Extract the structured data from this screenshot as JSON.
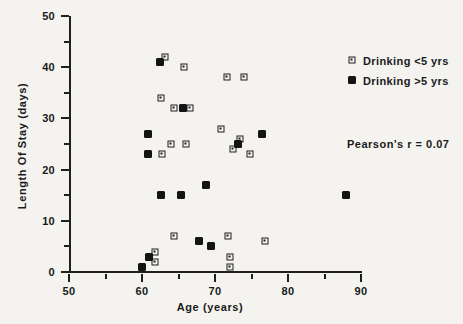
{
  "chart_data": {
    "type": "scatter",
    "title": "",
    "xlabel": "Age  (years)",
    "ylabel": "Length Of Stay (days)",
    "xlim": [
      50,
      90
    ],
    "ylim": [
      0,
      50
    ],
    "xticks": [
      50,
      60,
      70,
      80,
      90
    ],
    "yticks": [
      0,
      10,
      20,
      30,
      40,
      50
    ],
    "xminorticks": [
      55,
      65,
      75,
      85
    ],
    "yminorticks": [
      5,
      15,
      25,
      35,
      45
    ],
    "grid": false,
    "legend_position": "top-right",
    "annotations": [
      {
        "name": "pearson-r",
        "text": "Pearson's  r  =  0.07"
      }
    ],
    "series": [
      {
        "name": "Drinking <5 yrs",
        "marker": "open-square",
        "points": [
          [
            63.2,
            42.0
          ],
          [
            65.8,
            40.0
          ],
          [
            62.6,
            34.0
          ],
          [
            64.4,
            32.0
          ],
          [
            66.6,
            32.0
          ],
          [
            71.6,
            38.0
          ],
          [
            74.0,
            38.0
          ],
          [
            64.0,
            25.0
          ],
          [
            66.0,
            25.0
          ],
          [
            70.8,
            28.0
          ],
          [
            73.4,
            26.0
          ],
          [
            72.4,
            24.0
          ],
          [
            74.8,
            23.0
          ],
          [
            62.8,
            23.0
          ],
          [
            64.4,
            7.0
          ],
          [
            71.8,
            7.0
          ],
          [
            76.8,
            6.0
          ],
          [
            61.8,
            4.0
          ],
          [
            61.8,
            2.0
          ],
          [
            72.0,
            3.0
          ],
          [
            72.0,
            1.0
          ]
        ]
      },
      {
        "name": "Drinking >5 yrs",
        "marker": "filled-diamond",
        "points": [
          [
            62.4,
            41.0
          ],
          [
            65.6,
            32.0
          ],
          [
            60.8,
            27.0
          ],
          [
            60.8,
            23.0
          ],
          [
            73.2,
            25.0
          ],
          [
            76.4,
            27.0
          ],
          [
            62.6,
            15.0
          ],
          [
            65.4,
            15.0
          ],
          [
            68.8,
            17.0
          ],
          [
            88.0,
            15.0
          ],
          [
            67.8,
            6.0
          ],
          [
            69.4,
            5.0
          ],
          [
            61.0,
            3.0
          ],
          [
            60.0,
            1.0
          ]
        ]
      }
    ]
  }
}
